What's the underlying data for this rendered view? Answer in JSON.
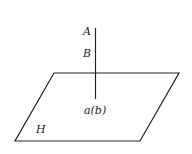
{
  "diagram": {
    "plane": {
      "label": "H",
      "vertices": [
        [
          54,
          73
        ],
        [
          179,
          73
        ],
        [
          140,
          141
        ],
        [
          15,
          141
        ]
      ],
      "stroke": "#222222"
    },
    "line": {
      "x": 95.5,
      "y_top": 28,
      "y_bottom": 99,
      "stroke": "#222222"
    },
    "labels": {
      "point_a": "A",
      "point_b": "B",
      "projection": "a(b)",
      "plane": "H"
    }
  }
}
